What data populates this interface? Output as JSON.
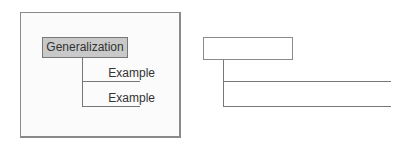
{
  "left_diagram": {
    "root_label": "Generalization",
    "children": [
      {
        "label": "Example"
      },
      {
        "label": "Example"
      }
    ]
  },
  "right_diagram": {
    "root_label": "",
    "children": [
      {
        "label": ""
      },
      {
        "label": ""
      }
    ]
  },
  "colors": {
    "root_fill": "#c9c9c9",
    "line": "#777777",
    "panel_border": "#8a8a8a"
  }
}
